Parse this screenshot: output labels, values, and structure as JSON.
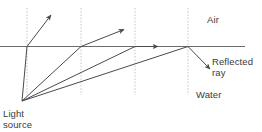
{
  "diagram": {
    "labels": {
      "air": "Air",
      "water": "Water",
      "reflected_ray": "Reflected\nray",
      "light_source": "Light\nsource",
      "clipped_top_text": ""
    },
    "colors": {
      "ray": "#4a4a4a",
      "interface": "#6b6b6b",
      "normal": "#b5b5b5",
      "text": "#3a3a3a",
      "background": "#ffffff"
    },
    "geometry": {
      "interface_y": 46.5,
      "source": {
        "x": 22,
        "y": 101
      },
      "normals_x": [
        27,
        81,
        135,
        188
      ],
      "normal_top_y": 8,
      "normal_bottom_y": 95,
      "interface_x_start": 0,
      "interface_x_end": 245
    },
    "rays": {
      "incident": [
        {
          "name": "incident-ray-1",
          "x1": 22,
          "y1": 101,
          "x2": 27,
          "y2": 46.5
        },
        {
          "name": "incident-ray-2",
          "x1": 22,
          "y1": 101,
          "x2": 81,
          "y2": 46.5
        },
        {
          "name": "incident-ray-3",
          "x1": 22,
          "y1": 101,
          "x2": 135,
          "y2": 46.5
        },
        {
          "name": "incident-ray-4",
          "x1": 22,
          "y1": 101,
          "x2": 188,
          "y2": 46.5
        }
      ],
      "refracted": [
        {
          "name": "refracted-ray-1",
          "x1": 27,
          "y1": 46.5,
          "x2": 52,
          "y2": 14
        },
        {
          "name": "refracted-ray-2",
          "x1": 81,
          "y1": 46.5,
          "x2": 125,
          "y2": 29
        },
        {
          "name": "refracted-ray-3-grazing",
          "x1": 135,
          "y1": 46.5,
          "x2": 160,
          "y2": 46.5
        }
      ],
      "reflected": [
        {
          "name": "reflected-ray-1",
          "x1": 188,
          "y1": 46.5,
          "x2": 212,
          "y2": 71
        }
      ]
    }
  }
}
